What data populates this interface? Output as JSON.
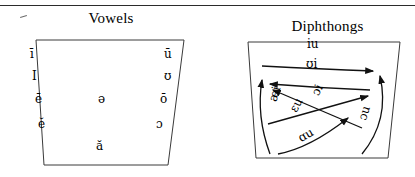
{
  "figure": {
    "panels": [
      {
        "id": "vowels",
        "title": "Vowels",
        "symbols": [
          {
            "label": "ī",
            "x": 22,
            "y": 38
          },
          {
            "label": "I",
            "x": 24,
            "y": 60
          },
          {
            "label": "ē",
            "x": 27,
            "y": 83
          },
          {
            "label": "ĕ",
            "x": 30,
            "y": 108
          },
          {
            "label": "ə",
            "x": 90,
            "y": 83
          },
          {
            "label": "ă",
            "x": 88,
            "y": 130
          },
          {
            "label": "ū",
            "x": 156,
            "y": 38
          },
          {
            "label": "ʊ",
            "x": 156,
            "y": 60
          },
          {
            "label": "ō",
            "x": 152,
            "y": 83
          },
          {
            "label": "ɔ",
            "x": 148,
            "y": 108
          }
        ]
      },
      {
        "id": "diphthongs",
        "title": "Diphthongs",
        "symbols": [
          {
            "label": "iu",
            "x": 67,
            "y": 20,
            "rotate": 0
          },
          {
            "label": "ʊi",
            "x": 66,
            "y": 40,
            "rotate": 0
          },
          {
            "label": "ɔi",
            "x": 72,
            "y": 66,
            "rotate": -62
          },
          {
            "label": "ɛu",
            "x": 49,
            "y": 81,
            "rotate": -62
          },
          {
            "label": "æi",
            "x": 27,
            "y": 70,
            "rotate": -74
          },
          {
            "label": "ɔu",
            "x": 117,
            "y": 89,
            "rotate": -72
          },
          {
            "label": "ɑu",
            "x": 58,
            "y": 111,
            "rotate": -30
          }
        ]
      }
    ]
  }
}
